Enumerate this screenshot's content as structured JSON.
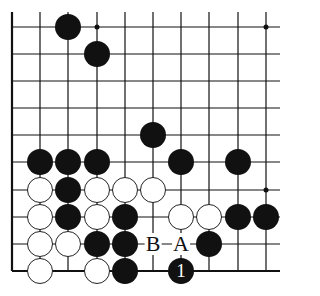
{
  "diagram": {
    "type": "go-board-fragment",
    "columns_x": [
      12,
      40,
      68,
      97,
      125,
      153,
      181,
      209,
      238,
      266
    ],
    "rows_y": [
      27,
      54,
      81,
      108,
      135,
      162,
      190,
      217,
      244,
      271
    ],
    "line_extent": {
      "left": 12,
      "right": 280,
      "top": 12,
      "bottom": 271
    },
    "edges": [
      "left",
      "bottom"
    ],
    "hoshi": [
      {
        "col": 3,
        "row": 0
      },
      {
        "col": 9,
        "row": 0
      },
      {
        "col": 9,
        "row": 6
      }
    ],
    "stones": [
      {
        "color": "black",
        "col": 2,
        "row": 0
      },
      {
        "color": "black",
        "col": 3,
        "row": 1
      },
      {
        "color": "black",
        "col": 5,
        "row": 4
      },
      {
        "color": "black",
        "col": 1,
        "row": 5
      },
      {
        "color": "black",
        "col": 2,
        "row": 5
      },
      {
        "color": "black",
        "col": 3,
        "row": 5
      },
      {
        "color": "black",
        "col": 6,
        "row": 5
      },
      {
        "color": "black",
        "col": 8,
        "row": 5
      },
      {
        "color": "white",
        "col": 1,
        "row": 6
      },
      {
        "color": "black",
        "col": 2,
        "row": 6
      },
      {
        "color": "white",
        "col": 3,
        "row": 6
      },
      {
        "color": "white",
        "col": 4,
        "row": 6
      },
      {
        "color": "white",
        "col": 5,
        "row": 6
      },
      {
        "color": "white",
        "col": 1,
        "row": 7
      },
      {
        "color": "black",
        "col": 2,
        "row": 7
      },
      {
        "color": "white",
        "col": 3,
        "row": 7
      },
      {
        "color": "black",
        "col": 4,
        "row": 7
      },
      {
        "color": "white",
        "col": 6,
        "row": 7
      },
      {
        "color": "white",
        "col": 7,
        "row": 7
      },
      {
        "color": "black",
        "col": 8,
        "row": 7
      },
      {
        "color": "black",
        "col": 9,
        "row": 7
      },
      {
        "color": "white",
        "col": 1,
        "row": 8
      },
      {
        "color": "white",
        "col": 2,
        "row": 8
      },
      {
        "color": "black",
        "col": 3,
        "row": 8
      },
      {
        "color": "black",
        "col": 4,
        "row": 8
      },
      {
        "color": "black",
        "col": 7,
        "row": 8
      },
      {
        "color": "white",
        "col": 1,
        "row": 9
      },
      {
        "color": "white",
        "col": 3,
        "row": 9
      },
      {
        "color": "black",
        "col": 4,
        "row": 9
      },
      {
        "color": "black",
        "col": 6,
        "row": 9,
        "number": "1"
      }
    ],
    "labels": [
      {
        "text": "B",
        "col": 5,
        "row": 8
      },
      {
        "text": "A",
        "col": 6,
        "row": 8
      }
    ]
  }
}
